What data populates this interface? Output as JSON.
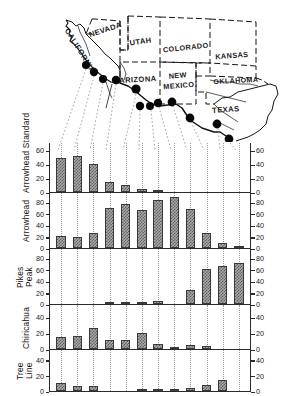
{
  "figure": {
    "map": {
      "name": "southwestern-united-states-map",
      "state_labels": [
        {
          "name": "NEVADA",
          "x": 106,
          "y": 32,
          "rotate": -18,
          "size": 7.6
        },
        {
          "name": "CALIFORNIA",
          "x": 78,
          "y": 52,
          "rotate": 58,
          "size": 7.6
        },
        {
          "name": "UTAH",
          "x": 148,
          "y": 42,
          "rotate": -8,
          "size": 7.6
        },
        {
          "name": "COLORADO",
          "x": 188,
          "y": 50,
          "rotate": -6,
          "size": 7.4
        },
        {
          "name": "KANSAS",
          "x": 232,
          "y": 58,
          "rotate": -4,
          "size": 7.4
        },
        {
          "name": "ARIZONA",
          "x": 140,
          "y": 80,
          "rotate": -3,
          "size": 7.6
        },
        {
          "name": "NEW",
          "x": 178,
          "y": 78,
          "rotate": -4,
          "size": 7.4
        },
        {
          "name": "MEXICO",
          "x": 178,
          "y": 88,
          "rotate": -4,
          "size": 7.4
        },
        {
          "name": "OKLAHOMA",
          "x": 234,
          "y": 82,
          "rotate": -3,
          "size": 7.2
        },
        {
          "name": "TEXAS",
          "x": 225,
          "y": 110,
          "rotate": -4,
          "size": 7.6
        }
      ],
      "site_dots": [
        {
          "label": "site-1",
          "x": 86,
          "y": 65,
          "r": 4.0
        },
        {
          "label": "site-2",
          "x": 94,
          "y": 72,
          "r": 4.2
        },
        {
          "label": "site-3",
          "x": 103,
          "y": 79,
          "r": 4.0
        },
        {
          "label": "site-4",
          "x": 116,
          "y": 80,
          "r": 4.2
        },
        {
          "label": "site-5",
          "x": 136,
          "y": 89,
          "r": 4.6
        },
        {
          "label": "site-6",
          "x": 140,
          "y": 106,
          "r": 4.2
        },
        {
          "label": "site-7",
          "x": 150,
          "y": 106,
          "r": 4.0
        },
        {
          "label": "site-8",
          "x": 158,
          "y": 103,
          "r": 4.2
        },
        {
          "label": "site-9",
          "x": 172,
          "y": 102,
          "r": 4.4
        },
        {
          "label": "site-10",
          "x": 190,
          "y": 118,
          "r": 4.4
        },
        {
          "label": "site-11",
          "x": 217,
          "y": 124,
          "r": 4.4
        },
        {
          "label": "site-12",
          "x": 229,
          "y": 139,
          "r": 4.4
        }
      ]
    },
    "axis_note": "Left and right vertical axes show percent frequency (0-80)."
  },
  "chart_data": {
    "type": "bar",
    "xlabel": "",
    "ylabel": "Percent frequency",
    "grid": true,
    "legend": "none",
    "categories": [
      "1",
      "2",
      "3",
      "4",
      "5",
      "6",
      "7",
      "8",
      "9",
      "10",
      "11",
      "12"
    ],
    "panels": [
      {
        "name": "Arrowhead Standard",
        "label_lines": [
          "Arrowhead Standard"
        ],
        "ylim": [
          0,
          70
        ],
        "yticks": [
          0,
          20,
          40,
          60
        ],
        "values": [
          49,
          52,
          41,
          14,
          10,
          4,
          1,
          0,
          0,
          0,
          0,
          0
        ]
      },
      {
        "name": "Arrowhead",
        "label_lines": [
          "Arrowhead"
        ],
        "ylim": [
          0,
          95
        ],
        "yticks": [
          0,
          20,
          40,
          60,
          80
        ],
        "values": [
          22,
          20,
          27,
          71,
          77,
          66,
          85,
          89,
          68,
          26,
          8,
          2
        ]
      },
      {
        "name": "Pikes Peak",
        "label_lines": [
          "Pikes",
          "Peak"
        ],
        "ylim": [
          0,
          95
        ],
        "yticks": [
          0,
          20,
          40,
          60,
          80
        ],
        "values": [
          0,
          0,
          0,
          4,
          4,
          4,
          5,
          0,
          24,
          62,
          66,
          73
        ]
      },
      {
        "name": "Chiricahua",
        "label_lines": [
          "Chiricahua"
        ],
        "ylim": [
          0,
          55
        ],
        "yticks": [
          0,
          20,
          40
        ],
        "values": [
          15,
          17,
          27,
          12,
          11,
          21,
          7,
          3,
          5,
          4,
          0,
          0
        ]
      },
      {
        "name": "Tree Line",
        "label_lines": [
          "Tree",
          "Line"
        ],
        "ylim": [
          0,
          52
        ],
        "yticks": [
          0,
          20,
          40
        ],
        "values": [
          11,
          6,
          6,
          0,
          0,
          1,
          1,
          2,
          4,
          8,
          14,
          0
        ]
      }
    ]
  },
  "colors": {
    "bar_fill": "#aaaaaa",
    "bar_hatch": "#5e5e5e",
    "bar_edge": "#3a3a3a",
    "axis": "#2b2b2b",
    "grid": "#9a9a9a",
    "map_ink": "#111111",
    "dot": "#080808"
  }
}
